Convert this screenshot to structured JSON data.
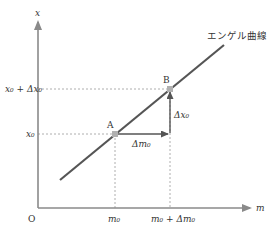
{
  "diagram": {
    "type": "engel-curve",
    "axes": {
      "y_label": "x",
      "x_label": "m",
      "origin_label": "O"
    },
    "curve": {
      "label": "エンゲル曲線",
      "color": "#555555"
    },
    "points": [
      {
        "name": "A",
        "label": "A",
        "x_tick": "m₀",
        "y_tick": "x₀"
      },
      {
        "name": "B",
        "label": "B",
        "x_tick": "m₀ + Δm₀",
        "y_tick": "x₀ + Δx₀"
      }
    ],
    "arrows": {
      "horizontal_label": "Δm₀",
      "vertical_label": "Δx₀"
    },
    "y_ticks": [
      "x₀ + Δx₀",
      "x₀"
    ],
    "x_ticks": [
      "m₀",
      "m₀ + Δm₀"
    ],
    "colors": {
      "axis": "#8a8a8a",
      "curve": "#555555",
      "point": "#b0b0b0",
      "guide": "#999999",
      "text": "#333333"
    }
  }
}
